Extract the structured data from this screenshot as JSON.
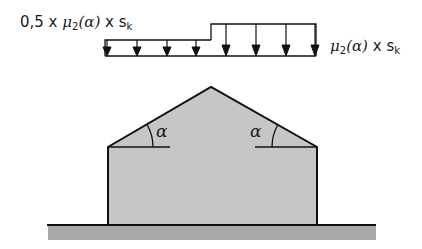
{
  "diagram": {
    "load_left": {
      "prefix": "0,5 x ",
      "mu": "μ",
      "mu_sub": "2",
      "angle_expr": "(α)",
      "times": " x s",
      "s_sub": "k"
    },
    "load_right": {
      "mu": "μ",
      "mu_sub": "2",
      "angle_expr": "(α)",
      "times": " x s",
      "s_sub": "k"
    },
    "angle_left": "α",
    "angle_right": "α",
    "colors": {
      "building_fill": "#c6c6c6",
      "ground_fill": "#a9a9a9",
      "stroke": "#111111"
    },
    "arrows_left_x": [
      107,
      137,
      167,
      196
    ],
    "arrows_right_x": [
      226,
      256,
      286,
      315
    ]
  }
}
